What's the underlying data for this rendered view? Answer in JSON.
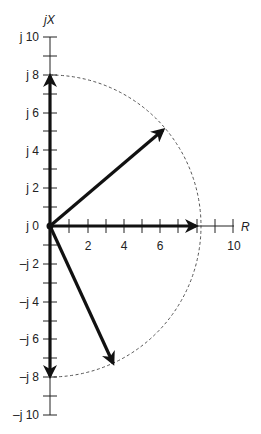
{
  "diagram": {
    "type": "phasor-diagram",
    "axes": {
      "x_label": "R",
      "y_label": "jX",
      "x_ticks": [
        "2",
        "4",
        "6",
        "10"
      ],
      "y_ticks": [
        "j 10",
        "j 8",
        "j 6",
        "j 4",
        "j 2",
        "j 0",
        "–j 2",
        "–j 4",
        "–j 6",
        "–j 8",
        "–j 10"
      ],
      "x_range": [
        0,
        10
      ],
      "y_range": [
        -10,
        10
      ]
    },
    "phasors": [
      {
        "name": "vertical-up",
        "end": [
          0,
          8
        ]
      },
      {
        "name": "diagonal-up",
        "end": [
          6.1,
          5.1
        ]
      },
      {
        "name": "horizontal",
        "end": [
          8,
          0
        ]
      },
      {
        "name": "diagonal-down",
        "end": [
          3.4,
          -7.2
        ]
      },
      {
        "name": "vertical-down",
        "end": [
          0,
          -8
        ]
      }
    ],
    "circle": {
      "radius": 8,
      "style": "dashed",
      "extent": "right half"
    }
  },
  "labels": {
    "y_axis": "jX",
    "x_axis": "R",
    "yt_10": "j 10",
    "yt_8": "j 8",
    "yt_6": "j 6",
    "yt_4": "j 4",
    "yt_2": "j 2",
    "yt_0": "j 0",
    "yt_m2": "–j 2",
    "yt_m4": "–j 4",
    "yt_m6": "–j 6",
    "yt_m8": "–j 8",
    "yt_m10": "–j 10",
    "xt_2": "2",
    "xt_4": "4",
    "xt_6": "6",
    "xt_10": "10"
  }
}
